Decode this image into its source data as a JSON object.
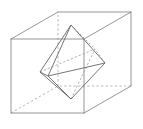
{
  "figure": {
    "projection": "oblique",
    "canvas": {
      "width": 143,
      "height": 129
    },
    "colors": {
      "background": "#ffffff",
      "cube_visible_edge": "#8a8a8a",
      "cube_hidden_edge": "#a8a8a8",
      "octahedron_visible_edge": "#6f6f6f",
      "octahedron_hidden_edge": "#9c9c9c"
    },
    "line_styles": {
      "visible": "solid",
      "hidden": "dashed"
    }
  },
  "cube": {
    "name": "cube",
    "vertices": {
      "front_top_left": {
        "label": "A",
        "x": 11,
        "y": 39
      },
      "front_top_right": {
        "label": "B",
        "x": 84,
        "y": 39
      },
      "front_bottom_right": {
        "label": "C",
        "x": 84,
        "y": 113
      },
      "front_bottom_left": {
        "label": "D",
        "x": 11,
        "y": 113
      },
      "back_top_left": {
        "label": "E",
        "x": 58,
        "y": 12
      },
      "back_top_right": {
        "label": "F",
        "x": 131,
        "y": 12
      },
      "back_bottom_right": {
        "label": "G",
        "x": 131,
        "y": 86
      },
      "back_bottom_left": {
        "label": "H",
        "x": 58,
        "y": 86
      }
    },
    "edges_visible": [
      [
        "front_top_left",
        "front_top_right"
      ],
      [
        "front_top_right",
        "front_bottom_right"
      ],
      [
        "front_bottom_right",
        "front_bottom_left"
      ],
      [
        "front_bottom_left",
        "front_top_left"
      ],
      [
        "back_top_left",
        "back_top_right"
      ],
      [
        "back_top_right",
        "back_bottom_right"
      ],
      [
        "front_top_left",
        "back_top_left"
      ],
      [
        "front_top_right",
        "back_top_right"
      ],
      [
        "front_bottom_right",
        "back_bottom_right"
      ]
    ],
    "edges_hidden": [
      [
        "back_bottom_right",
        "back_bottom_left"
      ],
      [
        "back_bottom_left",
        "back_top_left"
      ],
      [
        "front_bottom_left",
        "back_bottom_left"
      ]
    ]
  },
  "octahedron": {
    "name": "octahedron",
    "vertex_meaning": "each vertex is the center of one cube face",
    "vertices": {
      "top": {
        "label": "T",
        "x": 71,
        "y": 25,
        "cube_face": "top"
      },
      "bottom": {
        "label": "U",
        "x": 71,
        "y": 99,
        "cube_face": "bottom"
      },
      "left": {
        "label": "L",
        "x": 40,
        "y": 72,
        "cube_face": "left"
      },
      "right": {
        "label": "R",
        "x": 105,
        "y": 63,
        "cube_face": "right"
      },
      "front": {
        "label": "N",
        "x": 48,
        "y": 76,
        "cube_face": "front"
      },
      "back": {
        "label": "K",
        "x": 95,
        "y": 49,
        "cube_face": "back"
      }
    },
    "edges_visible": [
      [
        "top",
        "left"
      ],
      [
        "top",
        "right"
      ],
      [
        "top",
        "front"
      ],
      [
        "bottom",
        "left"
      ],
      [
        "bottom",
        "right"
      ],
      [
        "bottom",
        "front"
      ],
      [
        "left",
        "front"
      ],
      [
        "right",
        "front"
      ]
    ],
    "edges_hidden": [
      [
        "top",
        "back"
      ],
      [
        "bottom",
        "back"
      ],
      [
        "left",
        "back"
      ],
      [
        "right",
        "back"
      ]
    ]
  }
}
